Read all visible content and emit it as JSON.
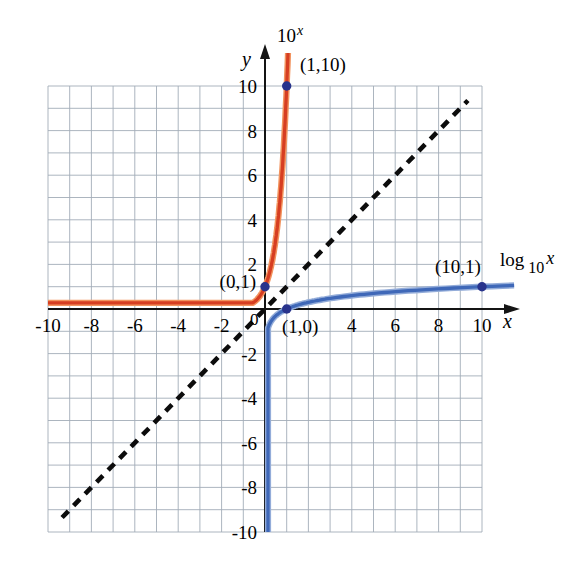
{
  "figure": {
    "background": "#ffffff",
    "axes": {
      "x_label": "x",
      "y_label": "y",
      "origin_label": "0"
    },
    "annotations": {
      "exp_curve_label": {
        "base": "10",
        "sup": "x"
      },
      "log_curve_label": {
        "fn": "log",
        "sub": "10",
        "var": "x"
      },
      "point_1_10": "(1,10)",
      "point_0_1": "(0,1)",
      "point_1_0": "(1,0)",
      "point_10_1": "(10,1)"
    }
  },
  "chart_data": {
    "type": "line",
    "title": "",
    "xlabel": "x",
    "ylabel": "y",
    "x_range": [
      -10,
      10
    ],
    "y_range": [
      -10,
      10
    ],
    "grid": "on",
    "grid_step": 1,
    "x_tick_labels": [
      -10,
      -8,
      -6,
      -4,
      -2,
      4,
      6,
      8,
      10
    ],
    "y_tick_labels": [
      10,
      8,
      6,
      4,
      2,
      -2,
      -4,
      -6,
      -8,
      -10
    ],
    "series": [
      {
        "name": "10^x",
        "fn": "exp10",
        "expression": "y = 10^x",
        "color": "#d63e22",
        "style": "solid"
      },
      {
        "name": "log10x",
        "fn": "log10",
        "expression": "y = log10(x)",
        "color": "#3f68b8",
        "style": "solid"
      },
      {
        "name": "y=x",
        "fn": "identity",
        "expression": "y = x",
        "color": "#0c0c0c",
        "style": "dashed"
      }
    ],
    "points": [
      {
        "x": 1,
        "y": 10,
        "label": "(1,10)"
      },
      {
        "x": 0,
        "y": 1,
        "label": "(0,1)"
      },
      {
        "x": 1,
        "y": 0,
        "label": "(1,0)"
      },
      {
        "x": 10,
        "y": 1,
        "label": "(10,1)"
      }
    ],
    "point_color": "#28338c",
    "colors": {
      "grid": "#a3adb8",
      "axis": "#141414"
    }
  }
}
